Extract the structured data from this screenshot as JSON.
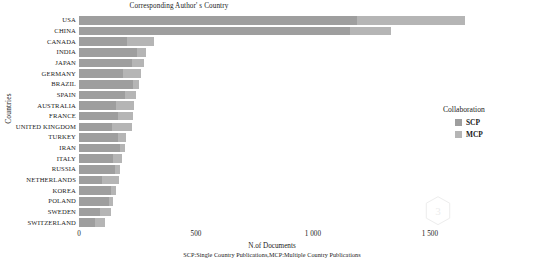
{
  "chart_data": {
    "type": "bar",
    "orientation": "horizontal",
    "stacked": true,
    "title": "Corresponding Author' s Country",
    "xlabel": "N.of Documents",
    "ylabel": "Countries",
    "caption": "SCP:Single Country Publications,MCP:Multiple Country Publications",
    "grid": false,
    "legend": {
      "title": "Collaboration",
      "position": "right",
      "entries": [
        {
          "name": "SCP",
          "color": "#9e9e9e"
        },
        {
          "name": "MCP",
          "color": "#b5b5b5"
        }
      ]
    },
    "xlim": [
      0,
      1650
    ],
    "xticks": [
      0,
      500,
      1000,
      1500
    ],
    "xticklabels": [
      "0",
      "500",
      "1 000",
      "1 500"
    ],
    "categories": [
      "USA",
      "CHINA",
      "CANADA",
      "INDIA",
      "JAPAN",
      "GERMANY",
      "BRAZIL",
      "SPAIN",
      "AUSTRALIA",
      "FRANCE",
      "UNITED KINGDOM",
      "TURKEY",
      "IRAN",
      "ITALY",
      "RUSSIA",
      "NETHERLANDS",
      "KOREA",
      "POLAND",
      "SWEDEN",
      "SWITZERLAND"
    ],
    "series": [
      {
        "name": "SCP",
        "color": "#9e9e9e",
        "values": [
          1190,
          1160,
          205,
          250,
          225,
          190,
          230,
          195,
          160,
          165,
          140,
          165,
          175,
          145,
          155,
          100,
          135,
          130,
          90,
          70
        ]
      },
      {
        "name": "MCP",
        "color": "#b5b5b5",
        "values": [
          460,
          175,
          115,
          35,
          55,
          75,
          25,
          50,
          75,
          65,
          85,
          35,
          20,
          40,
          20,
          70,
          25,
          15,
          45,
          40
        ]
      }
    ],
    "totals": [
      1650,
      1335,
      320,
      285,
      280,
      265,
      255,
      245,
      235,
      230,
      225,
      200,
      195,
      185,
      175,
      170,
      160,
      145,
      135,
      110
    ]
  }
}
